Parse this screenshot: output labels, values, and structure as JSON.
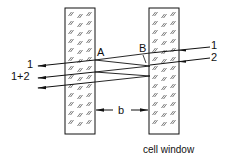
{
  "diagram": {
    "caption": "cell window",
    "point_labels": {
      "a": "A",
      "b": "B"
    },
    "gap_label": "b",
    "incoming_beams": [
      {
        "label": "1"
      },
      {
        "label": "2"
      }
    ],
    "outgoing_beams": [
      {
        "label": "1"
      },
      {
        "label": "1+2"
      },
      {
        "label": ""
      }
    ],
    "colors": {
      "stroke": "#111111",
      "hatch": "#444444",
      "background": "#ffffff"
    }
  }
}
